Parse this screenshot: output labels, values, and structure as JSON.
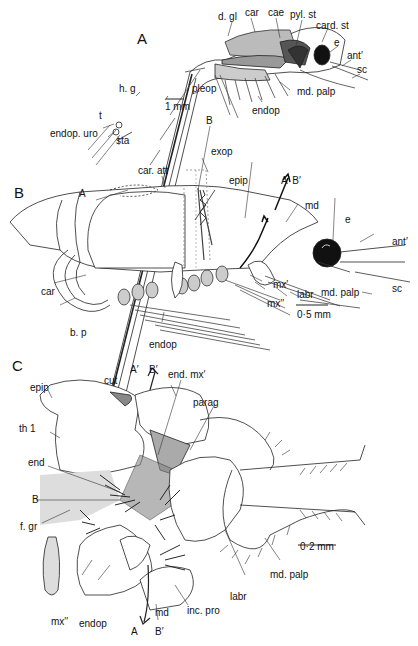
{
  "figure": {
    "panels": [
      {
        "id": "A",
        "label": "A",
        "scale_bar": "1 mm",
        "labels": [
          "d. gl",
          "car",
          "cae",
          "pyl. st",
          "card. st",
          "e",
          "ant′",
          "sc",
          "md. palp",
          "endop",
          "pleop",
          "h. g",
          "t",
          "endop. uro",
          "sta"
        ]
      },
      {
        "id": "B",
        "label": "B",
        "scale_bar": "0·5 mm",
        "labels": [
          "B",
          "exop",
          "car. att",
          "epip",
          "A′ B′",
          "A",
          "md",
          "e",
          "ant′",
          "car",
          "mx′",
          "mx′′",
          "labr",
          "md. palp",
          "sc",
          "b. p",
          "endop"
        ]
      },
      {
        "id": "C",
        "label": "C",
        "scale_bar": "0·2 mm",
        "labels": [
          "A′",
          "B′",
          "end. mx′",
          "cut",
          "epip",
          "parag",
          "th 1",
          "end",
          "B",
          "f. gr",
          "labr",
          "md. palp",
          "mx′′",
          "endop",
          "md",
          "inc. pro",
          "A",
          "B′"
        ]
      }
    ]
  },
  "A": {
    "panel": "A",
    "d_gl": "d. gl",
    "car": "car",
    "cae": "cae",
    "pyl_st": "pyl. st",
    "card_st": "card. st",
    "e": "e",
    "ant": "ant′",
    "sc": "sc",
    "md_palp": "md. palp",
    "endop": "endop",
    "pleop": "pleop",
    "scale": "1 mm",
    "h_g": "h. g",
    "t": "t",
    "endop_uro": "endop. uro",
    "sta": "sta"
  },
  "B": {
    "panel": "B",
    "B": "B",
    "exop": "exop",
    "car_att": "car. att",
    "epip": "epip",
    "ab": "A′ B′",
    "A": "A",
    "md": "md",
    "e": "e",
    "ant": "ant′",
    "car": "car",
    "mx1": "mx′",
    "mx2": "mx′′",
    "labr": "labr",
    "md_palp": "md. palp",
    "sc": "sc",
    "scale": "0·5 mm",
    "b_p": "b. p",
    "endop": "endop"
  },
  "C": {
    "panel": "C",
    "A1": "A′",
    "B1": "B′",
    "end_mx": "end. mx′",
    "cut": "cut",
    "epip": "epip",
    "parag": "parag",
    "th1": "th 1",
    "end": "end",
    "B": "B",
    "f_gr": "f. gr",
    "scale": "0·2 mm",
    "labr": "labr",
    "md_palp": "md. palp",
    "mx2": "mx′′",
    "endop": "endop",
    "md": "md",
    "inc_pro": "inc. pro",
    "A": "A",
    "B2": "B′"
  }
}
